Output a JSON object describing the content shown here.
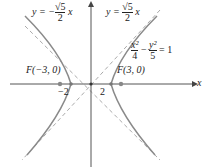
{
  "diagram": {
    "equation": {
      "lhs_num1": "x²",
      "lhs_den1": "4",
      "minus": "−",
      "lhs_num2": "y²",
      "lhs_den2": "5",
      "rhs": "= 1"
    },
    "asymptote_neg": {
      "prefix": "y = −",
      "num": "√5",
      "den": "2",
      "suffix": "x"
    },
    "asymptote_pos": {
      "prefix": "y =",
      "num": "√5",
      "den": "2",
      "suffix": "x"
    },
    "focus_left": "F(−3, 0)",
    "focus_right": "F(3, 0)",
    "vertex_left": "−2",
    "vertex_right": "2",
    "x_axis_label": "x",
    "colors": {
      "curve": "#8a8a8a",
      "axis": "#555555",
      "asymptote": "#aaaaaa",
      "point": "#888888"
    }
  }
}
